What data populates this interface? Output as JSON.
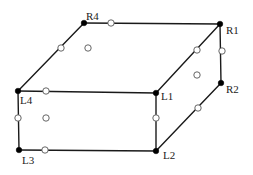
{
  "diagram": {
    "type": "box-perspective",
    "width": 253,
    "height": 175,
    "colors": {
      "edge": "#1a1a1a",
      "vertex": "#000000",
      "open_node_stroke": "#555555",
      "open_node_fill": "#ffffff",
      "label": "#222222"
    },
    "vertices": [
      {
        "id": "R4",
        "label": "R4",
        "x": 84,
        "y": 23,
        "lx": 86,
        "ly": 20
      },
      {
        "id": "R1",
        "label": "R1",
        "x": 220,
        "y": 24,
        "lx": 226,
        "ly": 34
      },
      {
        "id": "R2",
        "label": "R2",
        "x": 221,
        "y": 83,
        "lx": 226,
        "ly": 93
      },
      {
        "id": "L1",
        "label": "L1",
        "x": 156,
        "y": 93,
        "lx": 161,
        "ly": 100
      },
      {
        "id": "L4",
        "label": "L4",
        "x": 18,
        "y": 91,
        "lx": 20,
        "ly": 104
      },
      {
        "id": "L3",
        "label": "L3",
        "x": 19,
        "y": 150,
        "lx": 22,
        "ly": 164
      },
      {
        "id": "L2",
        "label": "L2",
        "x": 156,
        "y": 151,
        "lx": 163,
        "ly": 159
      }
    ],
    "edges": [
      [
        "R4",
        "R1"
      ],
      [
        "R4",
        "L4"
      ],
      [
        "R1",
        "L1"
      ],
      [
        "R1",
        "R2"
      ],
      [
        "R2",
        "L2"
      ],
      [
        "L4",
        "L1"
      ],
      [
        "L4",
        "L3"
      ],
      [
        "L1",
        "L2"
      ],
      [
        "L3",
        "L2"
      ]
    ],
    "open_nodes": [
      {
        "x": 111,
        "y": 23,
        "kind": "edge"
      },
      {
        "x": 61,
        "y": 48,
        "kind": "edge"
      },
      {
        "x": 88,
        "y": 48,
        "kind": "face"
      },
      {
        "x": 197,
        "y": 50,
        "kind": "edge"
      },
      {
        "x": 222,
        "y": 51,
        "kind": "edge"
      },
      {
        "x": 197,
        "y": 75,
        "kind": "face"
      },
      {
        "x": 46,
        "y": 91,
        "kind": "edge"
      },
      {
        "x": 18,
        "y": 118,
        "kind": "edge"
      },
      {
        "x": 46,
        "y": 118,
        "kind": "face"
      },
      {
        "x": 156,
        "y": 118,
        "kind": "edge"
      },
      {
        "x": 198,
        "y": 108,
        "kind": "edge"
      },
      {
        "x": 45,
        "y": 150,
        "kind": "edge"
      }
    ]
  }
}
